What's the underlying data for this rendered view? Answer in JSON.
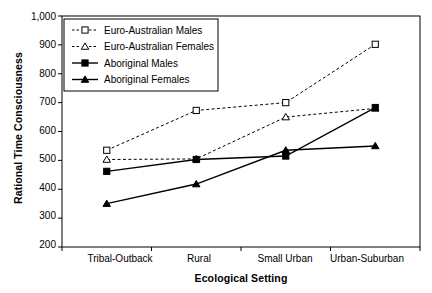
{
  "chart_data": {
    "type": "line",
    "title": "",
    "xlabel": "Ecological Setting",
    "ylabel": "Rational Time Consciousness",
    "categories": [
      "Tribal-Outback",
      "Rural",
      "Small Urban",
      "Urban-Suburban"
    ],
    "ylim": [
      200,
      1000
    ],
    "yticks": [
      200,
      300,
      400,
      500,
      600,
      700,
      800,
      900,
      1000
    ],
    "ytick_labels": [
      "200",
      "300",
      "400",
      "500",
      "600",
      "700",
      "800",
      "900",
      "1,000"
    ],
    "grid": false,
    "legend_position": "top-left",
    "series": [
      {
        "name": "Euro-Australian Males",
        "marker": "open-square",
        "line": "dashed",
        "color": "#000000",
        "values": [
          535,
          673,
          700,
          902
        ]
      },
      {
        "name": "Euro-Australian Females",
        "marker": "open-triangle",
        "line": "dashed",
        "color": "#000000",
        "values": [
          503,
          505,
          650,
          680
        ]
      },
      {
        "name": "Aboriginal Males",
        "marker": "filled-square",
        "line": "solid",
        "color": "#000000",
        "values": [
          462,
          503,
          515,
          683
        ]
      },
      {
        "name": "Aboriginal Females",
        "marker": "filled-triangle",
        "line": "solid",
        "color": "#000000",
        "values": [
          350,
          418,
          535,
          550
        ]
      }
    ]
  },
  "legend": {
    "items": [
      {
        "label": "Euro-Australian Males"
      },
      {
        "label": "Euro-Australian Females"
      },
      {
        "label": "Aboriginal Males"
      },
      {
        "label": "Aboriginal Females"
      }
    ]
  },
  "axes": {
    "y_title": "Rational Time Consciousness",
    "x_title": "Ecological Setting",
    "y_labels": [
      "1,000",
      "900",
      "800",
      "700",
      "600",
      "500",
      "400",
      "300",
      "200"
    ],
    "x_labels": [
      "Tribal-Outback",
      "Rural",
      "Small Urban",
      "Urban-Suburban"
    ]
  }
}
